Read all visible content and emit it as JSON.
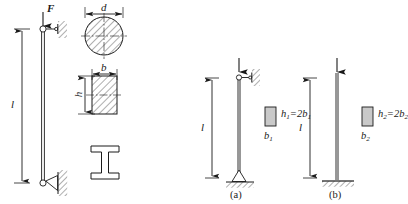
{
  "figure": {
    "type": "engineering-diagram",
    "background_color": "#ffffff",
    "line_color": "#1a1a1a",
    "fill_gray": "#c9c9c9"
  },
  "left_figure": {
    "name": "pin-ended-column",
    "load_label": "F",
    "length_label": "l",
    "top_support": "roller-against-wall",
    "bottom_support": "pin-on-wall",
    "column_orientation": "vertical"
  },
  "sections": {
    "circle": {
      "name": "circular-section",
      "dimension_label": "d",
      "hatched": true
    },
    "rectangle": {
      "name": "rectangular-section",
      "width_label": "b",
      "height_label": "h",
      "hatched": true
    },
    "ibeam": {
      "name": "i-beam-section",
      "label": ""
    }
  },
  "panels": [
    {
      "id": "a",
      "caption": "(a)",
      "length_label": "l",
      "base_label": "b",
      "base_sub": "1",
      "relation_h": "h",
      "relation_h_sub": "1",
      "relation_text": "=2",
      "relation_b": "b",
      "relation_b_sub": "1",
      "top_support": "roller-against-wall",
      "bottom_support": "pinned-triangle-on-ground",
      "has_load_arrow": true
    },
    {
      "id": "b",
      "caption": "(b)",
      "length_label": "l",
      "base_label": "b",
      "base_sub": "2",
      "relation_h": "h",
      "relation_h_sub": "2",
      "relation_text": "=2",
      "relation_b": "b",
      "relation_b_sub": "2",
      "top_support": "free-end",
      "bottom_support": "fixed-on-ground",
      "has_load_arrow": true
    }
  ]
}
